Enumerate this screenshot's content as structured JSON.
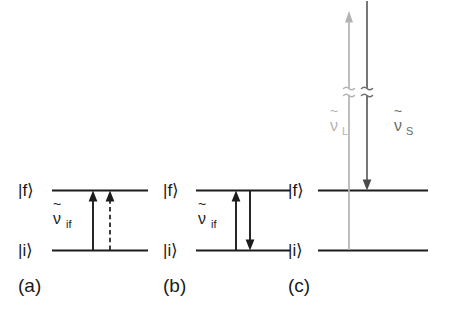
{
  "figure": {
    "background_color": "#ffffff",
    "dark_color": "#1c1c1c",
    "gray_color": "#b3b3b3",
    "mid_gray_color": "#6a6a6a",
    "panels": [
      {
        "id": "a",
        "caption": "(a)",
        "upper_state_label": "|f⟩",
        "lower_state_label": "|i⟩",
        "transition_label_symbol": "ν",
        "transition_label_tilde": "~",
        "transition_label_subscript": "if",
        "transition_label_full": "ν̃_if",
        "arrows": [
          {
            "name": "absorption-solid",
            "style": "solid",
            "direction": "up"
          },
          {
            "name": "absorption-dashed",
            "style": "dashed",
            "direction": "up"
          }
        ]
      },
      {
        "id": "b",
        "caption": "(b)",
        "upper_state_label": "|f⟩",
        "lower_state_label": "|i⟩",
        "transition_label_symbol": "ν",
        "transition_label_tilde": "~",
        "transition_label_subscript": "if",
        "transition_label_full": "ν̃_if",
        "arrows": [
          {
            "name": "absorption-solid",
            "style": "solid",
            "direction": "up"
          },
          {
            "name": "emission-solid",
            "style": "solid",
            "direction": "down"
          }
        ]
      },
      {
        "id": "c",
        "caption": "(c)",
        "upper_state_label": "|f⟩",
        "lower_state_label": "|i⟩",
        "laser_label_symbol": "ν",
        "laser_label_tilde": "~",
        "laser_label_subscript": "L",
        "laser_label_full": "ν̃_L",
        "scattered_label_symbol": "ν",
        "scattered_label_tilde": "~",
        "scattered_label_subscript": "S",
        "scattered_label_full": "ν̃_S",
        "arrows": [
          {
            "name": "laser-excitation",
            "style": "solid",
            "direction": "up",
            "color": "#b3b3b3",
            "broken": true
          },
          {
            "name": "scattered-photon",
            "style": "solid",
            "direction": "down",
            "color": "#5e5e5e",
            "broken": true
          }
        ]
      }
    ]
  }
}
